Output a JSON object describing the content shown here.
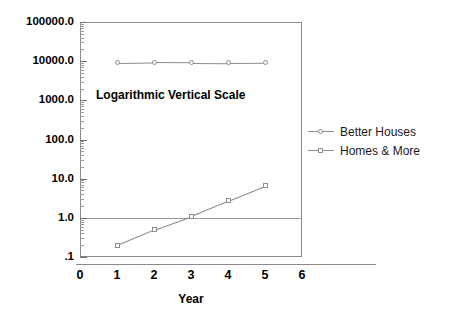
{
  "chart_data": {
    "type": "line",
    "title": "",
    "annotation": "Logarithmic Vertical Scale",
    "xlabel": "Year",
    "ylabel": "",
    "yscale": "log",
    "ylim": [
      0.1,
      100000
    ],
    "xlim": [
      0,
      6
    ],
    "grid": false,
    "reference_line_y": 1.0,
    "legend_position": "right",
    "x": [
      1,
      2,
      3,
      4,
      5
    ],
    "xticklabels": [
      "0",
      "1",
      "2",
      "3",
      "4",
      "5",
      "6"
    ],
    "xticks": [
      0,
      1,
      2,
      3,
      4,
      5,
      6
    ],
    "yticklabels": [
      "100000.0",
      "10000.0",
      "1000.0",
      "100.0",
      "10.0",
      "1.0",
      ".1"
    ],
    "yticks": [
      100000,
      10000,
      1000,
      100,
      10,
      1,
      0.1
    ],
    "series": [
      {
        "name": "Better Houses",
        "marker": "circle",
        "values": [
          9000,
          9300,
          9200,
          9000,
          9100
        ]
      },
      {
        "name": "Homes & More",
        "marker": "square",
        "values": [
          0.2,
          0.5,
          1.1,
          2.7,
          6.5
        ]
      }
    ]
  },
  "colors": {
    "line": "#8d8d8d",
    "frame": "#8a8a8a",
    "text": "#000000",
    "reference_line": "#9d9d9d",
    "background": "#ffffff"
  }
}
